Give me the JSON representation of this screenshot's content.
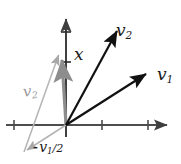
{
  "figure": {
    "background": "#ffffff",
    "width": 181,
    "height": 164,
    "colors": {
      "axis": "#4d4d4d",
      "vector_dark": "#111111",
      "vector_gray": "#a8a8a8",
      "text": "#1a1a1a",
      "text_gray": "#9a9a9a"
    }
  },
  "labels": {
    "v2_main": {
      "base": "v",
      "sub": "2"
    },
    "v1_main": {
      "base": "v",
      "sub": "1"
    },
    "x_axis_vector": {
      "base": "x"
    },
    "v2_gray": {
      "base": "v",
      "sub": "2"
    },
    "minus_half_v1": {
      "sign": "-",
      "base": "v",
      "sub": "1",
      "frac": "/2"
    }
  },
  "geometry": {
    "origin": {
      "x": 66,
      "y": 125
    },
    "x_axis": {
      "x1": 6,
      "y1": 125,
      "x2": 172,
      "y2": 125,
      "arrow": "right"
    },
    "y_axis": {
      "x1": 66,
      "y1": 135,
      "x2": 66,
      "y2": 14,
      "arrow": "up"
    },
    "x_ticks": [
      14,
      102,
      148
    ],
    "y_ticks": [
      32,
      62
    ],
    "vectors": [
      {
        "name": "v1",
        "color": "dark",
        "x1": 66,
        "y1": 125,
        "x2": 150,
        "y2": 71
      },
      {
        "name": "v2",
        "color": "dark",
        "x1": 66,
        "y1": 125,
        "x2": 119,
        "y2": 27
      },
      {
        "name": "x",
        "color": "gray",
        "x1": 66,
        "y1": 125,
        "x2": 61,
        "y2": 55
      },
      {
        "name": "minus-half-v1",
        "color": "gray",
        "x1": 66,
        "y1": 125,
        "x2": 24,
        "y2": 152
      },
      {
        "name": "v2-translated",
        "color": "gray",
        "x1": 24,
        "y1": 152,
        "x2": 58,
        "y2": 52
      }
    ]
  }
}
